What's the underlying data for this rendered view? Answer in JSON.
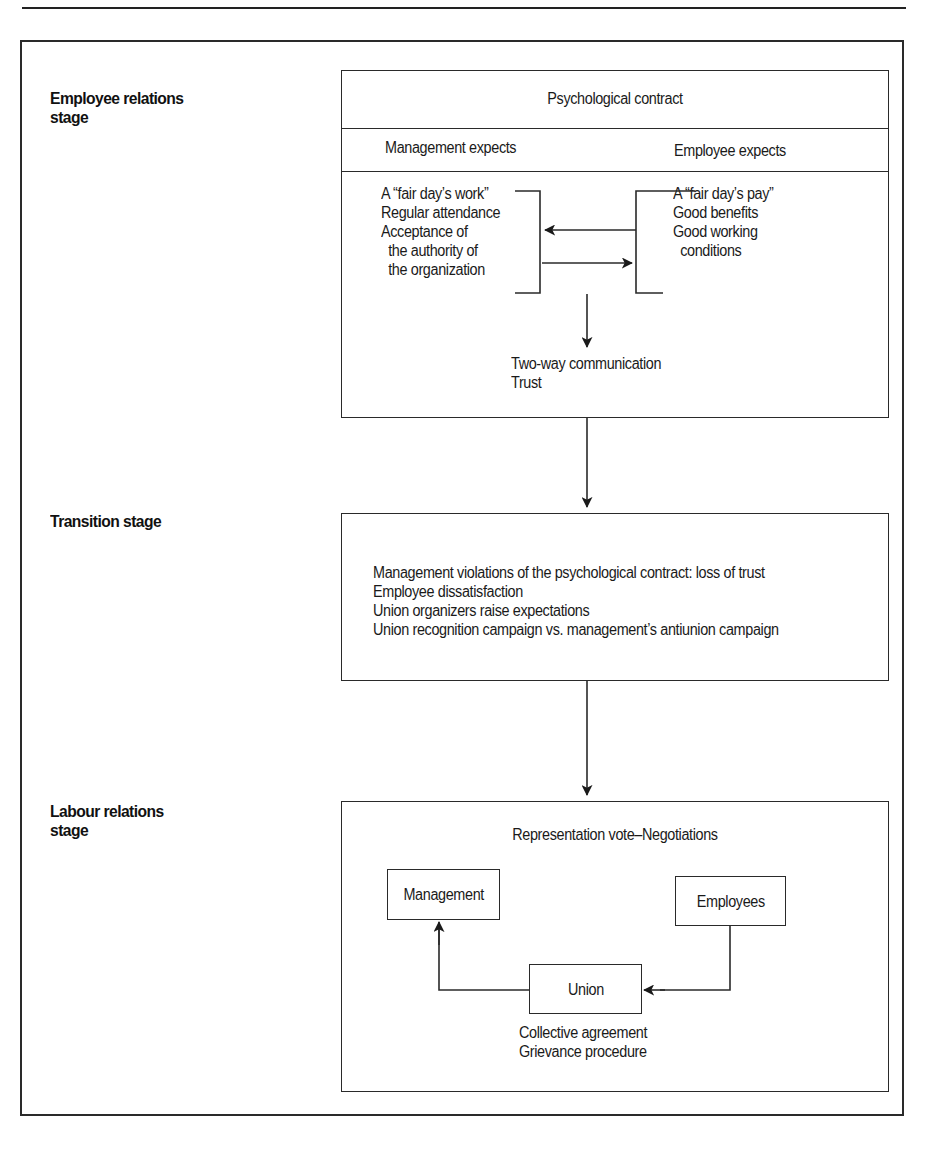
{
  "figure": {
    "stages": [
      {
        "label_line1": "Employee relations",
        "label_line2": "stage"
      },
      {
        "label_line1": "Transition stage",
        "label_line2": ""
      },
      {
        "label_line1": "Labour relations",
        "label_line2": "stage"
      }
    ],
    "employee_relations": {
      "title": "Psychological contract",
      "management_header": "Management expects",
      "employee_header": "Employee expects",
      "management_items": [
        "A “fair day’s work”",
        "Regular attendance",
        "Acceptance of",
        "the authority of",
        "the organization"
      ],
      "employee_items": [
        "A “fair day’s pay”",
        "Good benefits",
        "Good working",
        "conditions"
      ],
      "outcomes": [
        "Two-way communication",
        "Trust"
      ]
    },
    "transition": {
      "items": [
        "Management violations of the psychological contract: loss of trust",
        "Employee dissatisfaction",
        "Union organizers raise expectations",
        "Union recognition campaign vs. management’s antiunion campaign"
      ]
    },
    "labour_relations": {
      "title": "Representation vote–Negotiations",
      "nodes": {
        "management": "Management",
        "employees": "Employees",
        "union": "Union"
      },
      "outcomes": [
        "Collective agreement",
        "Grievance procedure"
      ]
    }
  },
  "colors": {
    "line": "#2a2a2a",
    "text": "#1a1a1a",
    "background": "#ffffff"
  }
}
